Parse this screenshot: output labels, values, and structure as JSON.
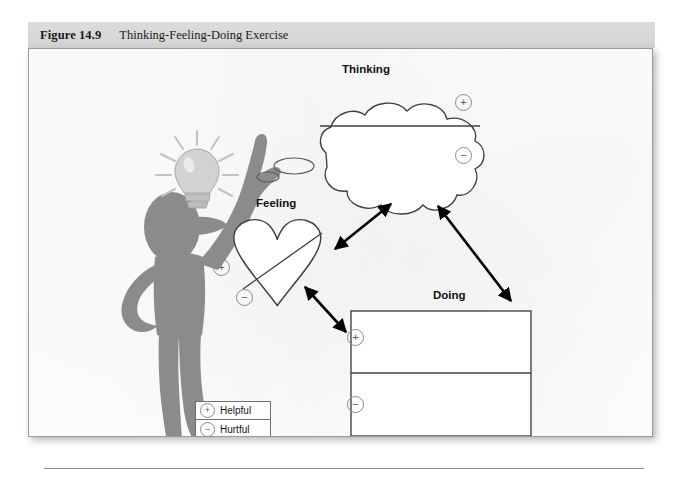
{
  "figure": {
    "number_label": "Figure 14.9",
    "title": "Thinking-Feeling-Doing Exercise"
  },
  "diagram": {
    "nodes": [
      {
        "id": "thinking",
        "label": "Thinking",
        "shape": "cloud"
      },
      {
        "id": "feeling",
        "label": "Feeling",
        "shape": "heart"
      },
      {
        "id": "doing",
        "label": "Doing",
        "shape": "rectangle"
      }
    ],
    "connections": [
      {
        "from": "feeling",
        "to": "thinking",
        "style": "double-arrow"
      },
      {
        "from": "doing",
        "to": "thinking",
        "style": "double-arrow"
      },
      {
        "from": "feeling",
        "to": "doing",
        "style": "double-arrow"
      }
    ],
    "signs": {
      "plus": "+",
      "minus": "−",
      "thinking_plus": "+",
      "thinking_minus": "−",
      "feeling_plus": "+",
      "feeling_minus": "−",
      "doing_plus": "+",
      "doing_minus": "−"
    },
    "person": {
      "description": "person-silhouette",
      "idea_icon": "lightbulb-icon",
      "thought_bubbles": 2
    }
  },
  "legend": {
    "rows": [
      {
        "sign": "+",
        "label": "Helpful"
      },
      {
        "sign": "−",
        "label": "Hurtful"
      }
    ]
  },
  "colors": {
    "caption_band": "#d9d9d9",
    "panel_border": "#9a9a9a",
    "person_fill": "#8b8b8b",
    "bulb_fill": "#cfcfcf",
    "outline": "#3f3f3f",
    "arrow": "#000000"
  }
}
